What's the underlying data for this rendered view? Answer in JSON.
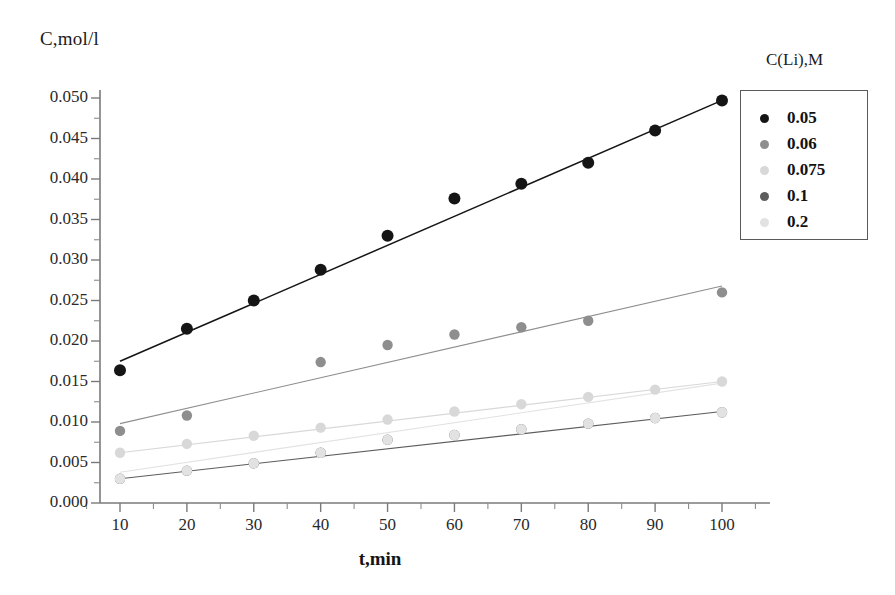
{
  "chart_data": {
    "type": "scatter",
    "title": "",
    "xlabel": "t,min",
    "ylabel": "C,mol/l",
    "x": [
      10,
      20,
      30,
      40,
      50,
      60,
      70,
      80,
      90,
      100
    ],
    "xlim": [
      5,
      105
    ],
    "ylim": [
      0.0,
      0.0515
    ],
    "xticks": [
      "10",
      "20",
      "30",
      "40",
      "50",
      "60",
      "70",
      "80",
      "90",
      "100"
    ],
    "yticks": [
      "0.000",
      "0.005",
      "0.010",
      "0.015",
      "0.020",
      "0.025",
      "0.030",
      "0.035",
      "0.040",
      "0.045",
      "0.050"
    ],
    "grid": false,
    "legend_title": "C(Li),M",
    "legend_position": "right",
    "series": [
      {
        "name": "0.05",
        "color": "#151515",
        "values": [
          0.0164,
          0.0215,
          0.025,
          0.0288,
          0.033,
          0.0376,
          0.0394,
          0.042,
          0.046,
          0.0497
        ],
        "fit_start": 0.0175,
        "fit_end": 0.0497
      },
      {
        "name": "0.06",
        "color": "#8e8e8e",
        "values": [
          0.0089,
          0.0108,
          null,
          0.0174,
          0.0195,
          0.0208,
          0.0217,
          0.0225,
          null,
          0.026
        ],
        "fit_start": 0.0098,
        "fit_end": 0.0268
      },
      {
        "name": "0.075",
        "color": "#d8d8d8",
        "values": [
          0.0062,
          0.0073,
          0.0083,
          0.0093,
          0.0103,
          0.0113,
          0.0122,
          0.0131,
          0.014,
          0.015
        ],
        "fit_start": 0.0062,
        "fit_end": 0.015
      },
      {
        "name": "0.1",
        "color": "#5d5d5d",
        "values": [
          0.003,
          0.004,
          0.0049,
          0.0062,
          0.0078,
          0.0084,
          0.0091,
          0.0098,
          0.0105,
          0.0112
        ],
        "fit_start": 0.003,
        "fit_end": 0.0113
      },
      {
        "name": "0.2",
        "color": "#e2e2e2",
        "values": [
          0.003,
          0.004,
          0.0049,
          0.0062,
          0.0078,
          0.0084,
          0.0091,
          0.0098,
          0.0105,
          0.0112
        ],
        "fit_start": 0.0038,
        "fit_end": 0.0148
      }
    ]
  },
  "axes": {
    "y_axis_label": "C,mol/l",
    "x_axis_label": "t,min"
  },
  "legend": {
    "title": "C(Li),M",
    "items": [
      {
        "label": "0.05",
        "color": "#151515"
      },
      {
        "label": "0.06",
        "color": "#8e8e8e"
      },
      {
        "label": "0.075",
        "color": "#d8d8d8"
      },
      {
        "label": "0.1",
        "color": "#5d5d5d"
      },
      {
        "label": "0.2",
        "color": "#e2e2e2"
      }
    ]
  }
}
